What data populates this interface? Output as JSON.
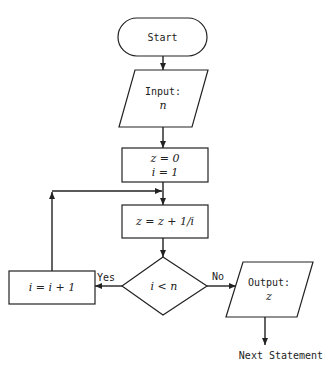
{
  "diagram": {
    "type": "flowchart",
    "nodes": {
      "start": {
        "shape": "terminal",
        "label": "Start"
      },
      "input": {
        "shape": "parallelogram",
        "label": "Input:",
        "var": "n"
      },
      "init": {
        "shape": "process",
        "line1": "z = 0",
        "line2": "i = 1"
      },
      "update_z": {
        "shape": "process",
        "label": "z = z + 1/i"
      },
      "decision": {
        "shape": "diamond",
        "label": "i < n"
      },
      "increment": {
        "shape": "process",
        "label": "i = i + 1"
      },
      "output": {
        "shape": "parallelogram",
        "label": "Output:",
        "var": "z"
      },
      "next": {
        "shape": "text",
        "label": "Next Statement"
      }
    },
    "edges": {
      "yes_label": "Yes",
      "no_label": "No"
    },
    "colors": {
      "stroke": "#222222",
      "background": "#ffffff"
    }
  }
}
